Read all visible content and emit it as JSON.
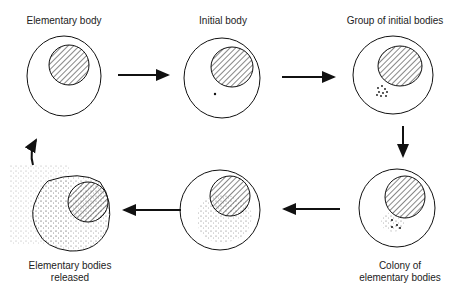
{
  "diagram": {
    "stages": [
      {
        "label": "Elementary body"
      },
      {
        "label": "Initial body"
      },
      {
        "label": "Group of initial bodies"
      },
      {
        "label_line1": "Colony of",
        "label_line2": "elementary bodies"
      },
      {
        "label": ""
      },
      {
        "label_line1": "Elementary bodies",
        "label_line2": "released"
      }
    ],
    "colors": {
      "stroke": "#111111",
      "stipple": "#555555"
    }
  }
}
